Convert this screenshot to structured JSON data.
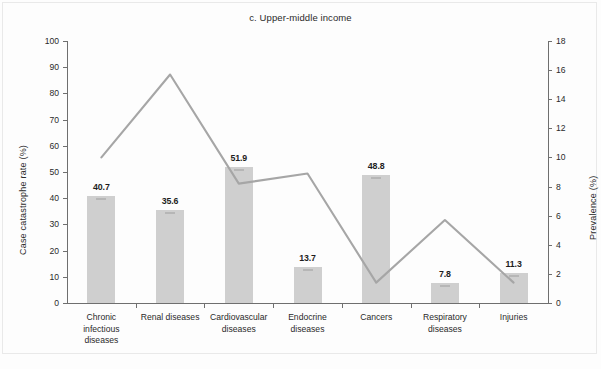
{
  "chart_data": {
    "type": "bar",
    "title": "c. Upper-middle income",
    "xlabel": "",
    "ylabel": "Case catastrophe rate (%)",
    "y2label": "Prevalence (%)",
    "categories": [
      "Chronic infectious diseases",
      "Renal diseases",
      "Cardiovascular diseases",
      "Endocrine diseases",
      "Cancers",
      "Respiratory diseases",
      "Injuries"
    ],
    "category_lines": [
      [
        "Chronic",
        "infectious",
        "diseases"
      ],
      [
        "Renal diseases"
      ],
      [
        "Cardiovascular",
        "diseases"
      ],
      [
        "Endocrine",
        "diseases"
      ],
      [
        "Cancers"
      ],
      [
        "Respiratory",
        "diseases"
      ],
      [
        "Injuries"
      ]
    ],
    "series": [
      {
        "name": "Case catastrophe rate (%)",
        "type": "bar",
        "axis": "left",
        "values": [
          40.7,
          35.6,
          51.9,
          13.7,
          48.8,
          7.8,
          11.3
        ],
        "labels": [
          "40.7",
          "35.6",
          "51.9",
          "13.7",
          "48.8",
          "7.8",
          "11.3"
        ],
        "color": "#cfcfcf"
      },
      {
        "name": "Prevalence (%)",
        "type": "line",
        "axis": "right",
        "values": [
          10.0,
          15.7,
          8.2,
          8.9,
          1.4,
          5.7,
          1.4
        ],
        "color": "#a6a6a6"
      }
    ],
    "ylim": [
      0,
      100
    ],
    "yticks": [
      0,
      10,
      20,
      30,
      40,
      50,
      60,
      70,
      80,
      90,
      100
    ],
    "y2lim": [
      0,
      18
    ],
    "y2ticks": [
      0,
      2,
      4,
      6,
      8,
      10,
      12,
      14,
      16,
      18
    ],
    "grid": false,
    "legend": "none"
  }
}
